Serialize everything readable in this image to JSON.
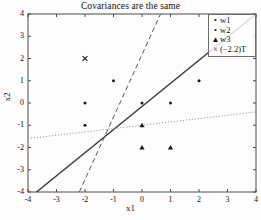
{
  "chart_data": {
    "type": "scatter",
    "title": "Covariances are the same",
    "xlabel": "x1",
    "ylabel": "x2",
    "xlim": [
      -4,
      4
    ],
    "ylim": [
      -4,
      4
    ],
    "xticks": [
      "-4",
      "-3",
      "-2",
      "-1",
      "0",
      "1",
      "2",
      "3",
      "4"
    ],
    "yticks": [
      "4",
      "3",
      "2",
      "1",
      "0",
      "-1",
      "-2",
      "-3",
      "-4"
    ],
    "xtick_values": [
      -4,
      -3,
      -2,
      -1,
      0,
      1,
      2,
      3,
      4
    ],
    "ytick_values": [
      4,
      3,
      2,
      1,
      0,
      -1,
      -2,
      -3,
      -4
    ],
    "grid": false,
    "legend_position": "top-right",
    "series": [
      {
        "name": "w1",
        "marker": "dot",
        "color": "#1a1a1a",
        "points": [
          [
            -2,
            0
          ],
          [
            -2,
            -1
          ],
          [
            -1,
            1
          ]
        ]
      },
      {
        "name": "w2",
        "marker": "dot",
        "color": "#1a1a1a",
        "points": [
          [
            0,
            0
          ],
          [
            1,
            0
          ],
          [
            2,
            1
          ]
        ]
      },
      {
        "name": "w3",
        "marker": "triangle",
        "color": "#1a1a1a",
        "points": [
          [
            0,
            -1
          ],
          [
            0,
            -2
          ],
          [
            1,
            -2
          ]
        ]
      },
      {
        "name": "(-2.2)T",
        "marker": "cross",
        "color": "#1a1a1a",
        "points": [
          [
            -2,
            2
          ]
        ]
      }
    ],
    "lines": [
      {
        "name": "boundary-solid",
        "style": "solid",
        "color": "#3a3a3a",
        "from": [
          -3.7,
          -4
        ],
        "to": [
          4,
          4
        ]
      },
      {
        "name": "boundary-dashed",
        "style": "dashed",
        "color": "#5a5a5a",
        "from": [
          -2.2,
          -4
        ],
        "to": [
          0.65,
          4
        ]
      },
      {
        "name": "boundary-dotted",
        "style": "dotted",
        "color": "#8a8a8a",
        "from": [
          -4,
          -1.6
        ],
        "to": [
          4,
          -0.4
        ]
      }
    ]
  },
  "legend": {
    "entries": [
      {
        "marker_glyph": "•",
        "label": "w1"
      },
      {
        "marker_glyph": "•",
        "label": "w2"
      },
      {
        "marker_glyph": "▲",
        "label": "w3"
      },
      {
        "marker_glyph": "×",
        "label": "(−2.2)T"
      }
    ]
  }
}
